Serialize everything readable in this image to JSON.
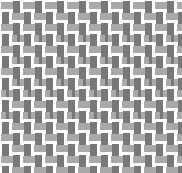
{
  "texture": {
    "name": "basketweave-texture",
    "width": 182,
    "height": 173,
    "background_color": "#ffffff",
    "horizontal_bar_color": "#a9a9a9",
    "vertical_bar_color": "#787878",
    "cell_width": 11,
    "cell_height": 11,
    "bar_thickness": 7,
    "gap": 4,
    "rows": 16,
    "columns": 17,
    "description": "Grayscale procedural basketweave / woven-brick texture fill",
    "pattern_type": "basketweave",
    "offset_mode": "half-cell-stagger",
    "dash_segment_width": 5,
    "dash_segment_gap": 3
  },
  "chart_data": {
    "type": "heatmap",
    "title": "",
    "xlabel": "",
    "ylabel": "",
    "grid": false,
    "legend": "none",
    "colors": [
      "#ffffff",
      "#a9a9a9",
      "#787878"
    ],
    "cell_size": [
      11,
      11
    ],
    "rows": 16,
    "columns": 17,
    "row_kinds": [
      "weave-solid",
      "weave-solid",
      "weave-solid",
      "weave-dashed",
      "weave-solid",
      "weave-dashed",
      "weave-solid",
      "weave-dashed",
      "weave-dashed",
      "weave-solid",
      "weave-dashed",
      "weave-solid",
      "weave-solid",
      "weave-solid",
      "weave-solid",
      "weave-solid"
    ],
    "values": [
      [
        1,
        2,
        1,
        2,
        1,
        2,
        1,
        2,
        1,
        2,
        1,
        2,
        1,
        2,
        1,
        2,
        1
      ],
      [
        2,
        1,
        2,
        1,
        2,
        1,
        2,
        1,
        2,
        1,
        2,
        1,
        2,
        1,
        2,
        1,
        2
      ],
      [
        1,
        2,
        1,
        2,
        1,
        2,
        1,
        2,
        1,
        2,
        1,
        2,
        1,
        2,
        1,
        2,
        1
      ],
      [
        2,
        1,
        2,
        1,
        2,
        1,
        2,
        1,
        2,
        1,
        2,
        1,
        2,
        1,
        2,
        1,
        2
      ],
      [
        1,
        2,
        1,
        2,
        1,
        2,
        1,
        2,
        1,
        2,
        1,
        2,
        1,
        2,
        1,
        2,
        1
      ],
      [
        2,
        1,
        2,
        1,
        2,
        1,
        2,
        1,
        2,
        1,
        2,
        1,
        2,
        1,
        2,
        1,
        2
      ],
      [
        1,
        2,
        1,
        2,
        1,
        2,
        1,
        2,
        1,
        2,
        1,
        2,
        1,
        2,
        1,
        2,
        1
      ],
      [
        2,
        1,
        2,
        1,
        2,
        1,
        2,
        1,
        2,
        1,
        2,
        1,
        2,
        1,
        2,
        1,
        2
      ],
      [
        1,
        2,
        1,
        2,
        1,
        2,
        1,
        2,
        1,
        2,
        1,
        2,
        1,
        2,
        1,
        2,
        1
      ],
      [
        2,
        1,
        2,
        1,
        2,
        1,
        2,
        1,
        2,
        1,
        2,
        1,
        2,
        1,
        2,
        1,
        2
      ],
      [
        1,
        2,
        1,
        2,
        1,
        2,
        1,
        2,
        1,
        2,
        1,
        2,
        1,
        2,
        1,
        2,
        1
      ],
      [
        2,
        1,
        2,
        1,
        2,
        1,
        2,
        1,
        2,
        1,
        2,
        1,
        2,
        1,
        2,
        1,
        2
      ],
      [
        1,
        2,
        1,
        2,
        1,
        2,
        1,
        2,
        1,
        2,
        1,
        2,
        1,
        2,
        1,
        2,
        1
      ],
      [
        2,
        1,
        2,
        1,
        2,
        1,
        2,
        1,
        2,
        1,
        2,
        1,
        2,
        1,
        2,
        1,
        2
      ],
      [
        1,
        2,
        1,
        2,
        1,
        2,
        1,
        2,
        1,
        2,
        1,
        2,
        1,
        2,
        1,
        2,
        1
      ],
      [
        2,
        1,
        2,
        1,
        2,
        1,
        2,
        1,
        2,
        1,
        2,
        1,
        2,
        1,
        2,
        1,
        2
      ]
    ]
  }
}
